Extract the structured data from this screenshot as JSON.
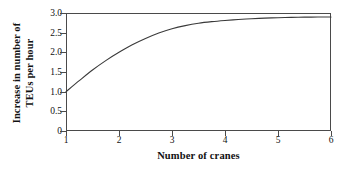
{
  "chart_data": {
    "type": "line",
    "title": "",
    "xlabel": "Number of cranes",
    "ylabel": "Increase in number of TEUs per hour",
    "ylabel_lines": [
      "Increase in number of",
      "TEUs per hour"
    ],
    "xlim": [
      1,
      6
    ],
    "ylim": [
      0,
      3.0
    ],
    "grid": false,
    "legend": null,
    "frame": "box",
    "x_ticks": [
      "1",
      "2",
      "3",
      "4",
      "5",
      "6"
    ],
    "x_tick_values": [
      1,
      2,
      3,
      4,
      5,
      6
    ],
    "y_ticks": [
      "0",
      "0.5",
      "1.0",
      "1.5",
      "2.0",
      "2.5",
      "3.0"
    ],
    "y_tick_values": [
      0,
      0.5,
      1.0,
      1.5,
      2.0,
      2.5,
      3.0
    ],
    "series": [
      {
        "name": "Increase in TEUs per hour",
        "color": "#3a3a3a",
        "x": [
          1.0,
          1.25,
          1.5,
          1.75,
          2.0,
          2.25,
          2.5,
          2.75,
          3.0,
          3.25,
          3.5,
          3.75,
          4.0,
          4.25,
          4.5,
          4.75,
          5.0,
          5.25,
          5.5,
          5.75,
          6.0
        ],
        "values": [
          1.0,
          1.28,
          1.55,
          1.79,
          2.0,
          2.19,
          2.35,
          2.49,
          2.6,
          2.68,
          2.74,
          2.78,
          2.81,
          2.835,
          2.855,
          2.87,
          2.88,
          2.888,
          2.894,
          2.898,
          2.9
        ]
      }
    ]
  },
  "figure": {
    "background_color": "#ffffff",
    "axis_color": "#4a4a4a",
    "text_color": "#111111"
  }
}
